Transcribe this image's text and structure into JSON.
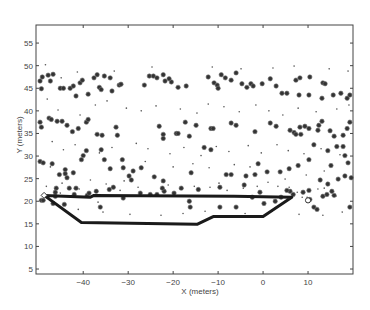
{
  "chart_data": {
    "type": "scatter",
    "title": "",
    "xlabel": "X (meters)",
    "ylabel": "Y (meters)",
    "xlim": [
      -50.5,
      20
    ],
    "ylim": [
      3.9,
      59
    ],
    "grid": false,
    "legend": null,
    "x_ticks": [
      -40,
      -30,
      -20,
      -10,
      0,
      10
    ],
    "y_ticks": [
      5,
      10,
      15,
      20,
      25,
      30,
      35,
      40,
      45,
      50,
      55
    ],
    "series": [
      {
        "name": "large markers (obstacles)",
        "marker": "filled-circle-large",
        "color": "#333333",
        "points": [
          [
            -49.6,
            46.6
          ],
          [
            -49.1,
            47.5
          ],
          [
            -49.3,
            44.9
          ],
          [
            -47.8,
            47.9
          ],
          [
            -46.7,
            48.1
          ],
          [
            -47.3,
            46.6
          ],
          [
            -45.1,
            45.0
          ],
          [
            -44.4,
            45.0
          ],
          [
            -42.9,
            45.0
          ],
          [
            -42.2,
            45.5
          ],
          [
            -41.6,
            43.3
          ],
          [
            -40.7,
            46.2
          ],
          [
            -40.2,
            46.8
          ],
          [
            -37.6,
            47.3
          ],
          [
            -36.9,
            48.0
          ],
          [
            -36.4,
            45.2
          ],
          [
            -38.9,
            43.7
          ],
          [
            -36.0,
            44.7
          ],
          [
            -35.3,
            47.7
          ],
          [
            -34.0,
            47.3
          ],
          [
            -33.6,
            44.4
          ],
          [
            -32.0,
            45.7
          ],
          [
            -31.6,
            45.9
          ],
          [
            -26.4,
            45.7
          ],
          [
            -25.3,
            47.7
          ],
          [
            -24.4,
            47.7
          ],
          [
            -23.6,
            47.3
          ],
          [
            -22.2,
            48.0
          ],
          [
            -21.8,
            46.6
          ],
          [
            -20.4,
            46.4
          ],
          [
            -20.9,
            47.1
          ],
          [
            -18.9,
            45.2
          ],
          [
            -17.1,
            45.5
          ],
          [
            -12.2,
            47.5
          ],
          [
            -9.3,
            48.0
          ],
          [
            -10.9,
            46.2
          ],
          [
            -10.2,
            45.7
          ],
          [
            -10.0,
            45.0
          ],
          [
            -8.4,
            47.3
          ],
          [
            -7.1,
            46.8
          ],
          [
            -6.0,
            48.4
          ],
          [
            -4.7,
            46.0
          ],
          [
            -3.6,
            45.2
          ],
          [
            -2.7,
            46.0
          ],
          [
            -2.2,
            45.5
          ],
          [
            -0.2,
            46.0
          ],
          [
            1.6,
            47.1
          ],
          [
            2.9,
            45.5
          ],
          [
            4.2,
            43.9
          ],
          [
            5.3,
            43.9
          ],
          [
            7.3,
            46.8
          ],
          [
            8.2,
            47.3
          ],
          [
            10.4,
            47.5
          ],
          [
            13.3,
            46.2
          ],
          [
            13.8,
            46.0
          ],
          [
            15.6,
            43.5
          ],
          [
            18.7,
            42.8
          ],
          [
            19.3,
            43.5
          ],
          [
            17.3,
            43.9
          ],
          [
            13.1,
            42.8
          ],
          [
            10.2,
            43.5
          ],
          [
            8.0,
            43.5
          ],
          [
            -49.6,
            37.5
          ],
          [
            -49.3,
            36.4
          ],
          [
            -47.6,
            38.4
          ],
          [
            -47.1,
            38.1
          ],
          [
            -45.8,
            37.7
          ],
          [
            -44.7,
            37.7
          ],
          [
            -43.6,
            36.8
          ],
          [
            -42.4,
            35.4
          ],
          [
            -41.1,
            36.1
          ],
          [
            -39.3,
            37.5
          ],
          [
            -38.9,
            38.1
          ],
          [
            -36.9,
            34.8
          ],
          [
            -35.8,
            34.6
          ],
          [
            -32.7,
            36.4
          ],
          [
            -32.4,
            34.6
          ],
          [
            -23.1,
            36.6
          ],
          [
            -22.2,
            34.8
          ],
          [
            -22.2,
            33.9
          ],
          [
            -19.3,
            35.0
          ],
          [
            -18.9,
            35.0
          ],
          [
            -17.3,
            37.5
          ],
          [
            -16.4,
            34.4
          ],
          [
            -14.9,
            36.8
          ],
          [
            -11.6,
            36.1
          ],
          [
            -11.1,
            36.1
          ],
          [
            -7.1,
            37.3
          ],
          [
            -6.0,
            36.8
          ],
          [
            -1.8,
            35.4
          ],
          [
            1.6,
            37.3
          ],
          [
            2.9,
            36.6
          ],
          [
            6.9,
            35.2
          ],
          [
            7.3,
            34.8
          ],
          [
            8.2,
            36.4
          ],
          [
            10.2,
            36.1
          ],
          [
            12.4,
            36.8
          ],
          [
            14.9,
            35.6
          ],
          [
            15.8,
            34.4
          ],
          [
            17.8,
            34.6
          ],
          [
            18.7,
            36.1
          ],
          [
            19.3,
            37.5
          ],
          [
            13.1,
            37.7
          ],
          [
            12.2,
            35.7
          ],
          [
            9.3,
            36.6
          ],
          [
            6.0,
            35.7
          ],
          [
            -49.6,
            28.8
          ],
          [
            -48.9,
            28.5
          ],
          [
            -46.9,
            28.3
          ],
          [
            -45.3,
            25.9
          ],
          [
            -44.0,
            26.1
          ],
          [
            -44.0,
            27.0
          ],
          [
            -43.6,
            25.2
          ],
          [
            -42.2,
            26.3
          ],
          [
            -40.4,
            29.2
          ],
          [
            -40.0,
            30.1
          ],
          [
            -39.3,
            31.2
          ],
          [
            -36.0,
            31.4
          ],
          [
            -35.3,
            29.2
          ],
          [
            -34.0,
            27.2
          ],
          [
            -31.1,
            27.4
          ],
          [
            -31.3,
            29.2
          ],
          [
            -29.8,
            25.6
          ],
          [
            -28.9,
            26.7
          ],
          [
            -29.3,
            24.7
          ],
          [
            -27.1,
            27.4
          ],
          [
            -24.2,
            25.4
          ],
          [
            -22.2,
            24.5
          ],
          [
            -16.0,
            26.3
          ],
          [
            -13.1,
            31.9
          ],
          [
            -11.6,
            31.4
          ],
          [
            -8.2,
            25.9
          ],
          [
            -7.1,
            25.9
          ],
          [
            -3.8,
            25.6
          ],
          [
            -1.8,
            25.9
          ],
          [
            -4.2,
            23.6
          ],
          [
            -1.1,
            28.3
          ],
          [
            0.9,
            26.5
          ],
          [
            3.8,
            26.5
          ],
          [
            5.8,
            27.2
          ],
          [
            7.8,
            27.9
          ],
          [
            10.2,
            29.2
          ],
          [
            12.7,
            24.7
          ],
          [
            14.4,
            23.8
          ],
          [
            16.7,
            24.9
          ],
          [
            18.2,
            25.6
          ],
          [
            19.6,
            25.2
          ],
          [
            15.1,
            27.9
          ],
          [
            16.4,
            32.1
          ],
          [
            17.8,
            32.1
          ],
          [
            18.2,
            30.1
          ],
          [
            18.9,
            28.5
          ],
          [
            14.4,
            31.2
          ],
          [
            11.3,
            32.5
          ],
          [
            8.4,
            34.8
          ],
          [
            -49.3,
            20.2
          ],
          [
            -48.9,
            20.2
          ],
          [
            -46.7,
            19.5
          ],
          [
            -46.2,
            21.1
          ],
          [
            -46.0,
            22.9
          ],
          [
            -46.2,
            22.0
          ],
          [
            -44.2,
            19.3
          ],
          [
            -43.1,
            22.9
          ],
          [
            -42.0,
            21.5
          ],
          [
            -41.6,
            22.9
          ],
          [
            -39.1,
            21.3
          ],
          [
            -38.7,
            21.8
          ],
          [
            -37.1,
            22.2
          ],
          [
            -36.2,
            18.7
          ],
          [
            -34.2,
            22.6
          ],
          [
            -33.3,
            23.1
          ],
          [
            -31.1,
            20.7
          ],
          [
            -27.3,
            21.8
          ],
          [
            -25.1,
            21.5
          ],
          [
            -23.6,
            21.5
          ],
          [
            -22.0,
            22.2
          ],
          [
            -22.4,
            22.9
          ],
          [
            -19.8,
            21.8
          ],
          [
            -18.2,
            22.9
          ],
          [
            -16.4,
            20.0
          ],
          [
            -14.4,
            22.6
          ],
          [
            -6.0,
            18.7
          ],
          [
            -2.4,
            20.9
          ],
          [
            0.2,
            19.5
          ],
          [
            2.7,
            20.0
          ],
          [
            4.0,
            20.9
          ],
          [
            6.0,
            22.2
          ],
          [
            8.9,
            22.0
          ],
          [
            10.2,
            22.4
          ],
          [
            10.4,
            20.4
          ],
          [
            11.3,
            18.7
          ],
          [
            12.0,
            18.2
          ],
          [
            13.3,
            21.1
          ],
          [
            14.2,
            21.5
          ],
          [
            15.3,
            22.2
          ],
          [
            15.8,
            21.3
          ],
          [
            19.3,
            18.7
          ],
          [
            -16.2,
            18.7
          ],
          [
            -9.6,
            18.7
          ],
          [
            -0.7,
            22.0
          ],
          [
            5.3,
            22.4
          ],
          [
            6.7,
            21.5
          ],
          [
            -9.6,
            23.1
          ]
        ]
      },
      {
        "name": "small markers (points)",
        "marker": "dot-small",
        "color": "#555555",
        "points": [
          [
            -48.4,
            50.2
          ],
          [
            -44.9,
            47.3
          ],
          [
            -41.3,
            48.6
          ],
          [
            -33.1,
            48.8
          ],
          [
            -24.7,
            49.7
          ],
          [
            -11.3,
            49.7
          ],
          [
            -4.9,
            49.3
          ],
          [
            2.2,
            49.5
          ],
          [
            6.9,
            49.9
          ],
          [
            14.7,
            49.3
          ],
          [
            18.9,
            48.8
          ],
          [
            -48.0,
            42.6
          ],
          [
            -45.6,
            40.2
          ],
          [
            -40.7,
            39.1
          ],
          [
            -37.3,
            41.3
          ],
          [
            -34.7,
            42.2
          ],
          [
            -30.4,
            40.6
          ],
          [
            -27.1,
            40.0
          ],
          [
            -23.8,
            41.1
          ],
          [
            -18.4,
            40.4
          ],
          [
            -14.7,
            39.5
          ],
          [
            -12.2,
            41.5
          ],
          [
            -8.7,
            40.9
          ],
          [
            -5.3,
            39.8
          ],
          [
            -1.6,
            41.3
          ],
          [
            1.3,
            40.0
          ],
          [
            4.4,
            39.1
          ],
          [
            7.8,
            40.6
          ],
          [
            11.8,
            39.8
          ],
          [
            16.4,
            40.4
          ],
          [
            19.1,
            41.3
          ],
          [
            -46.9,
            33.2
          ],
          [
            -44.4,
            31.4
          ],
          [
            -41.8,
            32.5
          ],
          [
            -36.4,
            30.7
          ],
          [
            -33.6,
            31.9
          ],
          [
            -28.2,
            32.8
          ],
          [
            -25.6,
            31.6
          ],
          [
            -20.7,
            30.5
          ],
          [
            -17.6,
            31.9
          ],
          [
            -13.8,
            30.1
          ],
          [
            -10.4,
            32.1
          ],
          [
            -7.6,
            31.0
          ],
          [
            -3.3,
            32.3
          ],
          [
            -0.4,
            30.7
          ],
          [
            3.1,
            32.5
          ],
          [
            5.6,
            31.2
          ],
          [
            9.1,
            30.5
          ],
          [
            12.9,
            31.6
          ],
          [
            17.1,
            30.3
          ],
          [
            -47.3,
            27.6
          ],
          [
            -44.7,
            24.0
          ],
          [
            -38.4,
            24.7
          ],
          [
            -34.9,
            23.8
          ],
          [
            -30.9,
            24.5
          ],
          [
            -26.2,
            28.8
          ],
          [
            -20.0,
            27.6
          ],
          [
            -15.6,
            28.3
          ],
          [
            -12.0,
            27.4
          ],
          [
            -9.8,
            24.0
          ],
          [
            -6.4,
            28.1
          ],
          [
            -2.9,
            27.6
          ],
          [
            1.1,
            24.2
          ],
          [
            4.9,
            24.9
          ],
          [
            9.6,
            25.8
          ],
          [
            13.6,
            26.7
          ],
          [
            -48.2,
            23.3
          ],
          [
            -45.1,
            21.8
          ],
          [
            -40.9,
            22.7
          ],
          [
            -36.7,
            19.8
          ],
          [
            -31.8,
            22.4
          ],
          [
            -27.8,
            23.1
          ],
          [
            -21.1,
            23.6
          ],
          [
            -15.3,
            23.3
          ],
          [
            -11.8,
            23.1
          ],
          [
            -8.0,
            22.4
          ],
          [
            -4.4,
            22.9
          ],
          [
            -1.3,
            23.3
          ],
          [
            3.3,
            23.3
          ],
          [
            5.8,
            23.1
          ],
          [
            7.6,
            22.0
          ],
          [
            8.7,
            20.9
          ],
          [
            9.8,
            20.9
          ],
          [
            12.2,
            22.7
          ],
          [
            13.6,
            22.9
          ],
          [
            16.2,
            21.1
          ],
          [
            -41.1,
            18.2
          ],
          [
            -35.6,
            17.6
          ],
          [
            -29.6,
            17.1
          ],
          [
            -22.7,
            16.9
          ],
          [
            -17.8,
            17.3
          ],
          [
            -12.9,
            17.8
          ],
          [
            -4.0,
            17.3
          ],
          [
            2.0,
            17.8
          ],
          [
            8.0,
            17.1
          ],
          [
            13.3,
            16.9
          ],
          [
            17.6,
            17.6
          ]
        ]
      },
      {
        "name": "trajectory",
        "type": "line",
        "color": "#1a1a1a",
        "points": [
          [
            -48.7,
            21.3
          ],
          [
            -38.4,
            20.9
          ],
          [
            -37.6,
            21.3
          ],
          [
            -6.4,
            21.1
          ],
          [
            6.4,
            20.9
          ],
          [
            0,
            16.6
          ],
          [
            -11.1,
            16.6
          ],
          [
            -14.7,
            14.9
          ],
          [
            -40.4,
            15.3
          ],
          [
            -48.7,
            21.3
          ]
        ]
      }
    ],
    "annotations": [
      {
        "type": "start-marker",
        "shape": "open-diamond",
        "x": -48.7,
        "y": 21.3
      },
      {
        "type": "goal-marker",
        "shape": "open-circle",
        "x": 10.0,
        "y": 20.2
      }
    ]
  }
}
